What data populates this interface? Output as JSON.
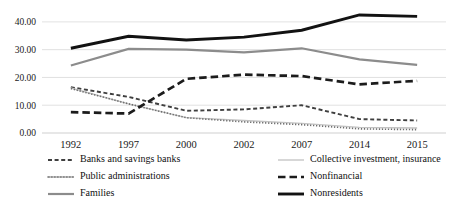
{
  "chart_data": {
    "type": "line",
    "title": "",
    "subtitle": "",
    "xlabel": "",
    "ylabel": "",
    "grid": true,
    "legend_position": "bottom",
    "categories": [
      "1992",
      "1997",
      "2000",
      "2002",
      "2007",
      "2014",
      "2015"
    ],
    "ylim": [
      0,
      45
    ],
    "ytick_labels": [
      "0.00",
      "10.00",
      "20.00",
      "30.00",
      "40.00"
    ],
    "ytick_values": [
      0,
      10,
      20,
      30,
      40
    ],
    "series": [
      {
        "name": "Banks and savings banks",
        "values": [
          16.5,
          13.0,
          8.0,
          8.5,
          10.0,
          5.0,
          4.5
        ],
        "color": "#3f3f3f",
        "style": "dashed-small",
        "width": 1.9,
        "dash": "4,2.6"
      },
      {
        "name": "Collective investment, insurance",
        "values": [
          16.2,
          10.5,
          5.5,
          4.5,
          3.5,
          2.0,
          1.8
        ],
        "color": "#c2c2c2",
        "style": "solid",
        "width": 1.3,
        "dash": "none"
      },
      {
        "name": "Public administrations",
        "values": [
          16.0,
          10.5,
          5.5,
          4.0,
          3.0,
          1.5,
          1.2
        ],
        "color": "#6e6e6e",
        "style": "dotted",
        "width": 1.6,
        "dash": "1.3,1.7"
      },
      {
        "name": "Nonfinancial",
        "values": [
          7.5,
          7.0,
          19.5,
          21.0,
          20.5,
          17.5,
          18.8
        ],
        "color": "#1c1c1c",
        "style": "dashed-large",
        "width": 2.7,
        "dash": "7.5,4"
      },
      {
        "name": "Families",
        "values": [
          24.3,
          30.3,
          30.0,
          29.0,
          30.5,
          26.5,
          24.5
        ],
        "color": "#8c8c8c",
        "style": "solid",
        "width": 2.2,
        "dash": "none"
      },
      {
        "name": "Nonresidents",
        "values": [
          30.5,
          34.8,
          33.5,
          34.5,
          37.0,
          42.5,
          42.0
        ],
        "color": "#121212",
        "style": "solid",
        "width": 2.9,
        "dash": "none"
      }
    ]
  },
  "legend": {
    "items": [
      {
        "label": "Banks and savings banks",
        "series_index": 0,
        "col": 0,
        "row": 0
      },
      {
        "label": "Collective investment, insurance",
        "series_index": 1,
        "col": 1,
        "row": 0
      },
      {
        "label": "Public administrations",
        "series_index": 2,
        "col": 0,
        "row": 1
      },
      {
        "label": "Nonfinancial",
        "series_index": 3,
        "col": 1,
        "row": 1
      },
      {
        "label": "Families",
        "series_index": 4,
        "col": 0,
        "row": 2
      },
      {
        "label": "Nonresidents",
        "series_index": 5,
        "col": 1,
        "row": 2
      }
    ]
  },
  "colors": {
    "grid": "#d9d9d9",
    "axis": "#c9c9c9",
    "text": "#111111",
    "background": "#ffffff"
  }
}
